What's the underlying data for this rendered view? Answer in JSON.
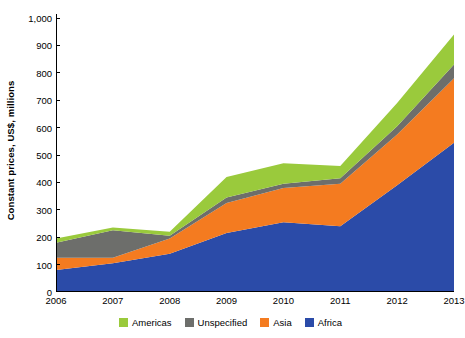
{
  "chart_data": {
    "type": "area",
    "stacked": true,
    "title": "",
    "xlabel": "",
    "ylabel": "Constant prices, US$, millions",
    "x": [
      2006,
      2007,
      2008,
      2009,
      2010,
      2011,
      2012,
      2013
    ],
    "categories": [
      "2006",
      "2007",
      "2008",
      "2009",
      "2010",
      "2011",
      "2012",
      "2013"
    ],
    "xtick_labels": [
      "2006",
      "2007",
      "2008",
      "2009",
      "2010",
      "2011",
      "2012",
      "2013"
    ],
    "ytick_labels": [
      "0",
      "100",
      "200",
      "300",
      "400",
      "500",
      "600",
      "700",
      "800",
      "900",
      "1,000"
    ],
    "ytick_values": [
      0,
      100,
      200,
      300,
      400,
      500,
      600,
      700,
      800,
      900,
      1000
    ],
    "ylim": [
      0,
      1000
    ],
    "xlim": [
      2006,
      2013
    ],
    "grid": false,
    "legend_position": "bottom",
    "stack_order_bottom_to_top": [
      "Africa",
      "Asia",
      "Unspecified",
      "Americas"
    ],
    "series": [
      {
        "name": "Africa",
        "color": "#2B4BA8",
        "values": [
          80,
          105,
          140,
          215,
          255,
          240,
          390,
          545
        ]
      },
      {
        "name": "Asia",
        "color": "#F47B20",
        "values": [
          45,
          20,
          55,
          110,
          125,
          155,
          185,
          235
        ]
      },
      {
        "name": "Unspecified",
        "color": "#6D6E6B",
        "values": [
          55,
          100,
          10,
          20,
          15,
          20,
          30,
          50
        ]
      },
      {
        "name": "Americas",
        "color": "#9ACA3C",
        "values": [
          15,
          10,
          15,
          75,
          75,
          45,
          85,
          110
        ]
      }
    ],
    "cumulative_tops": {
      "Africa": [
        80,
        105,
        140,
        215,
        255,
        240,
        390,
        545
      ],
      "Asia": [
        125,
        125,
        195,
        325,
        380,
        395,
        575,
        780
      ],
      "Unspecified": [
        180,
        225,
        205,
        345,
        395,
        415,
        605,
        830
      ],
      "Americas": [
        195,
        235,
        220,
        420,
        470,
        460,
        690,
        940
      ]
    }
  },
  "legend": {
    "items": [
      {
        "label": "Americas",
        "color": "#9ACA3C"
      },
      {
        "label": "Unspecified",
        "color": "#6D6E6B"
      },
      {
        "label": "Asia",
        "color": "#F47B20"
      },
      {
        "label": "Africa",
        "color": "#2B4BA8"
      }
    ]
  },
  "axes": {
    "y_title": "Constant prices, US$, millions",
    "axis_color": "#000000"
  }
}
